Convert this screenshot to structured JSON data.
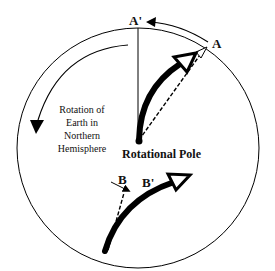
{
  "diagram": {
    "labels": {
      "a_prime": "A'",
      "a": "A",
      "b": "B",
      "b_prime": "B'",
      "pole": "Rotational Pole",
      "rotation_line1": "Rotation of",
      "rotation_line2": "Earth in",
      "rotation_line3": "Northern",
      "rotation_line4": "Hemisphere"
    },
    "colors": {
      "stroke": "#000000",
      "background": "#ffffff"
    }
  }
}
